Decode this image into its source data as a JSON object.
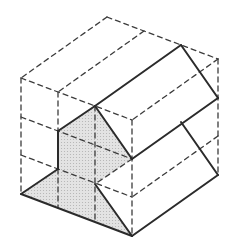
{
  "canvas": {
    "width": 229,
    "height": 243,
    "background": "#ffffff"
  },
  "diagram": {
    "figure_type": "isometric-cube-cross-section",
    "colors": {
      "solid_line": "#2b2b2b",
      "dashed_line": "#3c3c3c",
      "shade_fill": "#e3e3e3",
      "shade_dot": "#b0b0b0",
      "background": "#ffffff"
    },
    "style": {
      "solid_width": 2,
      "dashed_width": 1.3,
      "dash_array": "5 4",
      "dot_radius": 0.55,
      "dot_spacing": 3
    },
    "vertices": {
      "T": [
        107,
        17
      ],
      "UR": [
        218,
        59
      ],
      "UL": [
        21,
        78
      ],
      "F": [
        132,
        120
      ],
      "LL": [
        21,
        194
      ],
      "LR": [
        218,
        175
      ],
      "FB": [
        132,
        236
      ],
      "A": [
        181,
        45
      ],
      "A3": [
        144,
        31
      ],
      "V1": [
        58,
        92
      ],
      "C": [
        95,
        106
      ],
      "B1": [
        218,
        98
      ],
      "P1": [
        58,
        131
      ],
      "L3": [
        21,
        117
      ],
      "V2": [
        132,
        159
      ],
      "Q": [
        181,
        122
      ],
      "R3": [
        218,
        136
      ],
      "V4": [
        58,
        169
      ],
      "L4": [
        21,
        155
      ],
      "V3": [
        95,
        184
      ],
      "F3": [
        132,
        197
      ],
      "P1b": [
        58,
        208
      ],
      "V3b": [
        95,
        222
      ]
    },
    "solid_edges": [
      [
        "A",
        "C"
      ],
      [
        "C",
        "P1"
      ],
      [
        "A",
        "B1"
      ],
      [
        "B1",
        "V2"
      ],
      [
        "C",
        "V2"
      ],
      [
        "P1",
        "V4"
      ],
      [
        "V4",
        "LL"
      ],
      [
        "LL",
        "FB"
      ],
      [
        "FB",
        "LR"
      ],
      [
        "V3",
        "FB"
      ],
      [
        "Q",
        "LR"
      ]
    ],
    "dashed_edges": [
      [
        "T",
        "UL"
      ],
      [
        "T",
        "UR"
      ],
      [
        "UL",
        "LL"
      ],
      [
        "UR",
        "LR"
      ],
      [
        "UL",
        "F"
      ],
      [
        "UR",
        "F"
      ],
      [
        "F",
        "FB"
      ],
      [
        "A3",
        "V1"
      ],
      [
        "V1",
        "P1"
      ],
      [
        "V4",
        "P1b"
      ],
      [
        "C",
        "V3b"
      ],
      [
        "L3",
        "V2"
      ],
      [
        "L4",
        "F3"
      ],
      [
        "R3",
        "F3"
      ],
      [
        "V2",
        "V3"
      ]
    ],
    "shaded_polygon": [
      "C",
      "V2",
      "V3",
      "FB",
      "LL",
      "V4",
      "P1"
    ]
  }
}
